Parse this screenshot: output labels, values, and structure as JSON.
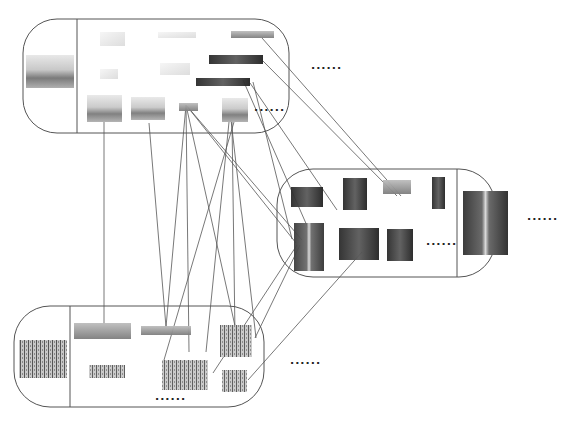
{
  "diagram": {
    "type": "image-cluster-correspondence",
    "ellipsis_text": "......",
    "stroke_color": "#555555",
    "groups": [
      {
        "id": "group-top",
        "box": {
          "x": 23,
          "y": 19,
          "w": 266,
          "h": 114,
          "r": 34
        },
        "divider_x": 77,
        "representative": {
          "x": 26,
          "y": 55,
          "w": 48,
          "h": 33,
          "tone": "coast"
        },
        "members": [
          {
            "x": 100,
            "y": 32,
            "w": 25,
            "h": 14,
            "tone": "faint"
          },
          {
            "x": 158,
            "y": 32,
            "w": 38,
            "h": 6,
            "tone": "faint"
          },
          {
            "x": 231,
            "y": 31,
            "w": 43,
            "h": 7,
            "tone": "mid"
          },
          {
            "x": 100,
            "y": 69,
            "w": 18,
            "h": 10,
            "tone": "faint"
          },
          {
            "x": 160,
            "y": 63,
            "w": 30,
            "h": 12,
            "tone": "faint"
          },
          {
            "x": 209,
            "y": 55,
            "w": 54,
            "h": 9,
            "tone": "dark"
          },
          {
            "x": 196,
            "y": 78,
            "w": 54,
            "h": 8,
            "tone": "dark"
          },
          {
            "x": 87,
            "y": 95,
            "w": 35,
            "h": 27,
            "tone": "coast"
          },
          {
            "x": 131,
            "y": 97,
            "w": 34,
            "h": 23,
            "tone": "coast"
          },
          {
            "x": 179,
            "y": 103,
            "w": 19,
            "h": 8,
            "tone": "mid"
          },
          {
            "x": 222,
            "y": 98,
            "w": 26,
            "h": 24,
            "tone": "coast"
          }
        ],
        "more_label_pos": {
          "x": 254,
          "y": 108
        }
      },
      {
        "id": "group-right",
        "box": {
          "x": 277,
          "y": 169,
          "w": 218,
          "h": 108,
          "r": 36
        },
        "divider_x": 457,
        "representative": {
          "x": 463,
          "y": 191,
          "w": 45,
          "h": 64,
          "tone": "tower"
        },
        "members": [
          {
            "x": 291,
            "y": 187,
            "w": 32,
            "h": 20,
            "tone": "dark"
          },
          {
            "x": 343,
            "y": 178,
            "w": 24,
            "h": 32,
            "tone": "dark"
          },
          {
            "x": 383,
            "y": 180,
            "w": 28,
            "h": 14,
            "tone": "mid"
          },
          {
            "x": 432,
            "y": 177,
            "w": 13,
            "h": 32,
            "tone": "dark"
          },
          {
            "x": 294,
            "y": 223,
            "w": 30,
            "h": 48,
            "tone": "tower"
          },
          {
            "x": 339,
            "y": 228,
            "w": 40,
            "h": 32,
            "tone": "dark"
          },
          {
            "x": 387,
            "y": 229,
            "w": 26,
            "h": 32,
            "tone": "dark"
          }
        ],
        "more_label_pos": {
          "x": 426,
          "y": 242
        }
      },
      {
        "id": "group-bottom",
        "box": {
          "x": 14,
          "y": 306,
          "w": 250,
          "h": 101,
          "r": 36
        },
        "divider_x": 70,
        "representative": {
          "x": 19,
          "y": 340,
          "w": 48,
          "h": 38,
          "tone": "field"
        },
        "members": [
          {
            "x": 74,
            "y": 323,
            "w": 57,
            "h": 16,
            "tone": "mid"
          },
          {
            "x": 141,
            "y": 326,
            "w": 50,
            "h": 9,
            "tone": "mid"
          },
          {
            "x": 220,
            "y": 325,
            "w": 32,
            "h": 32,
            "tone": "field"
          },
          {
            "x": 89,
            "y": 365,
            "w": 36,
            "h": 13,
            "tone": "field"
          },
          {
            "x": 162,
            "y": 360,
            "w": 46,
            "h": 30,
            "tone": "field"
          },
          {
            "x": 222,
            "y": 370,
            "w": 25,
            "h": 22,
            "tone": "field"
          }
        ],
        "more_label_pos": {
          "x": 155,
          "y": 397
        }
      }
    ],
    "outer_more_labels": [
      {
        "x": 311,
        "y": 66
      },
      {
        "x": 527,
        "y": 217
      },
      {
        "x": 290,
        "y": 361
      }
    ],
    "connections": [
      [
        262,
        38,
        401,
        196
      ],
      [
        262,
        60,
        397,
        196
      ],
      [
        250,
        83,
        337,
        210
      ],
      [
        253,
        82,
        292,
        239
      ],
      [
        243,
        80,
        308,
        228
      ],
      [
        186,
        105,
        296,
        243
      ],
      [
        186,
        105,
        302,
        240
      ],
      [
        186,
        105,
        166,
        327
      ],
      [
        186,
        105,
        189,
        352
      ],
      [
        186,
        105,
        237,
        335
      ],
      [
        104,
        122,
        104,
        324
      ],
      [
        149,
        123,
        166,
        327
      ],
      [
        229,
        122,
        206,
        352
      ],
      [
        232,
        122,
        235,
        335
      ],
      [
        234,
        122,
        164,
        360
      ],
      [
        297,
        245,
        213,
        373
      ],
      [
        300,
        245,
        255,
        338
      ],
      [
        362,
        252,
        248,
        380
      ],
      [
        231,
        120,
        256,
        338
      ]
    ]
  }
}
